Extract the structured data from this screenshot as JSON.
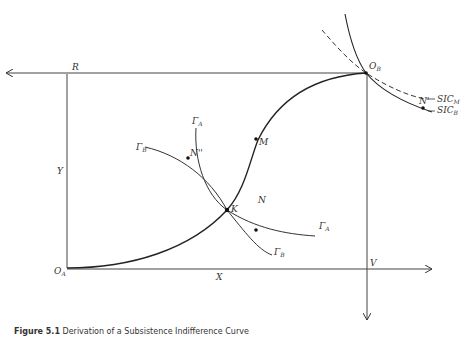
{
  "diagram": {
    "type": "edgeworth-box",
    "labels": {
      "origin_a": "O",
      "origin_a_sub": "A",
      "origin_b": "O",
      "origin_b_sub": "B",
      "corner_r": "R",
      "corner_v": "V",
      "axis_x": "X",
      "axis_y": "Y",
      "point_k": "K",
      "point_m": "M",
      "point_n": "N",
      "point_n_prime": "N'",
      "point_n_double_prime": "N''",
      "curve_gamma_b_left": "Γ",
      "curve_gamma_b_left_sub": "B",
      "curve_gamma_a_top": "Γ",
      "curve_gamma_a_top_sub": "A",
      "curve_gamma_a_right": "Γ",
      "curve_gamma_a_right_sub": "A",
      "curve_gamma_b_bottom": "Γ",
      "curve_gamma_b_bottom_sub": "B",
      "sic_m": "SIC",
      "sic_m_sub": "M",
      "sic_b": "SIC",
      "sic_b_sub": "B"
    },
    "colors": {
      "line": "#333333",
      "dashed": "#333333"
    }
  },
  "caption": {
    "label": "Figure 5.1",
    "text": "Derivation of a Subsistence Indifference Curve"
  }
}
